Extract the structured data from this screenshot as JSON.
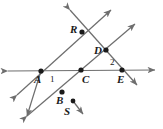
{
  "figure": {
    "type": "geometry-diagram",
    "background_color": "#ffffff",
    "line_color": "#6e6e6e",
    "point_color": "#1a1a1a",
    "label_color": "#1a1a1a"
  },
  "points": [
    {
      "id": "A",
      "label": "A",
      "x": 41,
      "y": 71,
      "label_x": 34,
      "label_y": 74
    },
    {
      "id": "B",
      "label": "B",
      "x": 62,
      "y": 92,
      "label_x": 56,
      "label_y": 95
    },
    {
      "id": "C",
      "label": "C",
      "x": 81,
      "y": 70,
      "label_x": 82,
      "label_y": 74
    },
    {
      "id": "D",
      "label": "D",
      "x": 106,
      "y": 50,
      "label_x": 94,
      "label_y": 45
    },
    {
      "id": "E",
      "label": "E",
      "x": 122,
      "y": 70,
      "label_x": 117,
      "label_y": 74
    },
    {
      "id": "R",
      "label": "R",
      "x": 82,
      "y": 32,
      "label_x": 70,
      "label_y": 24
    },
    {
      "id": "S",
      "label": "S",
      "x": 73,
      "y": 101,
      "label_x": 64,
      "label_y": 106
    }
  ],
  "angles": [
    {
      "id": "1",
      "label": "1",
      "label_x": 50,
      "label_y": 75
    },
    {
      "id": "2",
      "label": "2",
      "label_x": 110,
      "label_y": 58
    }
  ],
  "lines": [
    {
      "id": "horizontal-line",
      "from": "left-arrow",
      "through": "A, C, E",
      "to": "right-arrow"
    },
    {
      "id": "line-through-A-R",
      "from": "lower-left-arrow",
      "through": "A, R",
      "to": "upper-right-arrow"
    },
    {
      "id": "line-through-R-D-E",
      "from": "upper-left-arrow",
      "through": "R, D, E",
      "to": "lower-right-arrow"
    },
    {
      "id": "line-through-A-B",
      "from": "A",
      "through": "B",
      "to": "lower-left-arrow"
    },
    {
      "id": "line-through-B-C-D",
      "from": "lower-left-arrow",
      "through": "B, C, D",
      "to": "upper-right-arrow"
    },
    {
      "id": "ray-S",
      "from": "S",
      "through": "",
      "to": "lower-right-arrow"
    }
  ]
}
